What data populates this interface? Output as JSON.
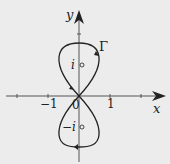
{
  "figure": {
    "axes": {
      "x_label": "x",
      "y_label": "y"
    },
    "ticks": {
      "x_neg_one": "−1",
      "origin": "0",
      "x_one": "1"
    },
    "curve": {
      "name": "Γ"
    },
    "points": {
      "upper": "i",
      "lower": "−i"
    },
    "colors": {
      "background": "#ececec",
      "ink": "#222222"
    }
  }
}
